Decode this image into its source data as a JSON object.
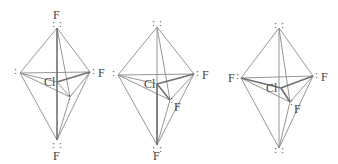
{
  "figure": {
    "line_color": "#8a8a8a",
    "bond_color": "#707070",
    "text_color": "#444444",
    "central_atom": "Cl",
    "ligand_atom": "F",
    "lone_pair_glyph": ":",
    "molecules": [
      {
        "name": "structure-1",
        "central_label": "Cl",
        "top_label": "F",
        "right_label": "F",
        "bottom_label": "F",
        "left_label": "",
        "front_label": "",
        "lone_pairs": [
          "left",
          "front"
        ]
      },
      {
        "name": "structure-2",
        "central_label": "Cl",
        "top_label": "",
        "right_label": "F",
        "bottom_label": "F",
        "left_label": "",
        "front_label": "F",
        "lone_pairs": [
          "top",
          "left"
        ]
      },
      {
        "name": "structure-3",
        "central_label": "Cl",
        "top_label": "",
        "right_label": "F",
        "bottom_label": "",
        "left_label": "F",
        "front_label": "F",
        "lone_pairs": [
          "top",
          "bottom"
        ]
      }
    ]
  }
}
